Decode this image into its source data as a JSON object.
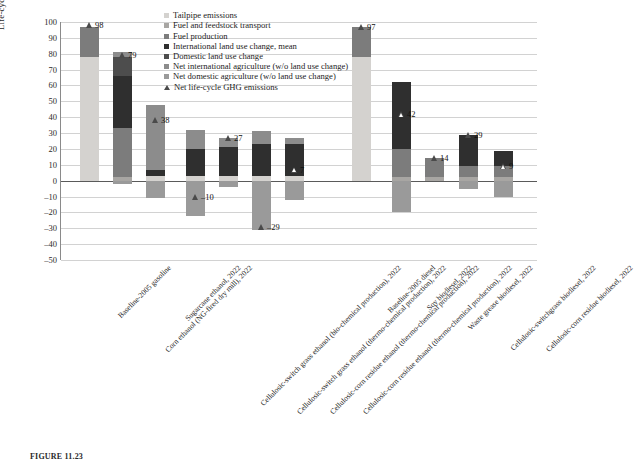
{
  "chart_data": {
    "type": "bar",
    "title": "",
    "xlabel": "",
    "ylabel": "Life-cycle GHG emissions (kg CO2e/mmBtu)",
    "ylim": [
      -50,
      100
    ],
    "ytick_step": 10,
    "grid": true,
    "stacked": true,
    "legend_position": "top-right",
    "yticks": [
      "100",
      "90",
      "80",
      "70",
      "60",
      "50",
      "40",
      "30",
      "20",
      "10",
      "0",
      "–10",
      "–20",
      "–30",
      "–40",
      "–50"
    ],
    "categories": [
      "Baseline-2005 gasoline",
      "Corn ethanol (NG-fired dry mill), 2022",
      "Sugarcane ethanol, 2022",
      "Cellulosic-switch grass ethanol (bio-chemical production), 2022",
      "Cellulosic-switch grass ethanol (thermo-chemical production), 2022",
      "Cellulosic-corn residue ethanol (thermo-chemical production), 2022",
      "Cellulosic-corn residue ethanol (thermo-chemical production), 2022",
      "Baseline-2005 diesel",
      "Soy biodiesel, 2022",
      "Waste grease biodiesel, 2022",
      "Cellulosic-switchgrass biodiesel, 2022",
      "Cellulosic-corn residue biodiesel, 2022"
    ],
    "series": [
      {
        "name": "Tailpipe emissions",
        "color": "#d4d2cf",
        "values": [
          78,
          0,
          3,
          3,
          3,
          3,
          3,
          78,
          0,
          0,
          0,
          0
        ]
      },
      {
        "name": "Fuel and feedstock transport",
        "color": "#a8a6a3",
        "values": [
          0,
          2,
          0,
          0,
          0,
          0,
          0,
          0,
          2,
          2,
          2,
          2
        ]
      },
      {
        "name": "Fuel production",
        "color": "#7c7c7c",
        "values": [
          19,
          31,
          0,
          0,
          0,
          0,
          0,
          19,
          18,
          12,
          7,
          7
        ]
      },
      {
        "name": "International land use change, mean",
        "color": "#2f2f2f",
        "values": [
          0,
          33,
          4,
          17,
          18,
          20,
          20,
          0,
          42,
          0,
          20,
          10
        ]
      },
      {
        "name": "Domestic land use change",
        "color": "#4d4d4d",
        "values": [
          0,
          12,
          0,
          0,
          0,
          0,
          0,
          0,
          0,
          0,
          0,
          0
        ]
      },
      {
        "name": "Net international agriculture (w/o land use change)",
        "color": "#8c8c8c",
        "values": [
          0,
          3,
          41,
          12,
          6,
          8,
          4,
          0,
          0,
          0,
          0,
          0
        ]
      },
      {
        "name": "Net domestic agriculture (w/o land use change)",
        "color": "#9a9a9a",
        "values": [
          0,
          -2,
          -11,
          -22,
          -4,
          -31,
          -12,
          0,
          -20,
          0,
          -5,
          -10
        ]
      }
    ],
    "net_series_name": "Net life-cycle GHG emissions",
    "net_values": [
      98,
      79,
      38,
      -10,
      27,
      -29,
      7,
      97,
      42,
      14,
      29,
      9
    ],
    "net_labels": [
      "98",
      "79",
      "38",
      "–10",
      "27",
      "–29",
      "7",
      "97",
      "42",
      "14",
      "29",
      "9"
    ],
    "net_marker_filled": [
      true,
      true,
      true,
      true,
      true,
      true,
      false,
      true,
      false,
      true,
      true,
      false
    ]
  },
  "legend": {
    "items": [
      {
        "label": "Tailpipe emissions",
        "color": "#d4d2cf",
        "type": "swatch"
      },
      {
        "label": "Fuel and feedstock transport",
        "color": "#a8a6a3",
        "type": "swatch"
      },
      {
        "label": "Fuel production",
        "color": "#7c7c7c",
        "type": "swatch"
      },
      {
        "label": "International land use change, mean",
        "color": "#2f2f2f",
        "type": "swatch"
      },
      {
        "label": "Domestic land use change",
        "color": "#4d4d4d",
        "type": "swatch"
      },
      {
        "label": "Net international agriculture (w/o land use change)",
        "color": "#8c8c8c",
        "type": "swatch"
      },
      {
        "label": "Net domestic agriculture (w/o land use change)",
        "color": "#9a9a9a",
        "type": "swatch"
      },
      {
        "label": "Net life-cycle GHG emissions",
        "color": "#4a4a4a",
        "type": "point"
      }
    ]
  },
  "caption": {
    "text": "FIGURE 11.23"
  }
}
